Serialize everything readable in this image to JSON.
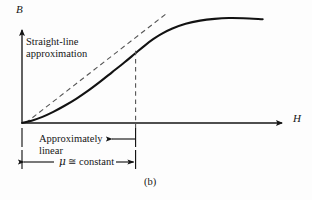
{
  "figure": {
    "caption": "(b)",
    "background_color": "#fdfdfd",
    "ink_color": "#151515",
    "curve_color": "#121212",
    "dashed_color": "#555555"
  },
  "axes": {
    "y_label": "B",
    "x_label": "H",
    "origin": {
      "x": 22,
      "y": 123
    },
    "y_axis_top": {
      "x": 22,
      "y": 27
    },
    "x_axis_right": {
      "x": 285,
      "y": 123
    }
  },
  "annotations": {
    "straight_line": {
      "line1": "Straight-line",
      "line2": "approximation"
    },
    "approximately_linear": {
      "line1": "Approximately",
      "line2": "linear"
    },
    "permeability": {
      "symbol": "μ",
      "relation": "≅",
      "value": "constant",
      "full": "μ ≅ constant"
    }
  },
  "chart_data": {
    "type": "line",
    "title": "",
    "subtitle": "",
    "xlabel": "H",
    "ylabel": "B",
    "grid": false,
    "legend": null,
    "axis_style": "arrow-headed half-axes, unlabeled ticks",
    "xlim": [
      0,
      1
    ],
    "ylim": [
      0,
      1
    ],
    "series": [
      {
        "name": "B-H magnetization curve",
        "style": "solid",
        "color": "#121212",
        "description": "S-shaped (sigmoid) saturation curve rising from the origin, steepest through the mid linear region, then flattening to saturation and drooping very slightly at the far right",
        "points": [
          {
            "x": 0.0,
            "y": 0.0
          },
          {
            "x": 0.04,
            "y": 0.022
          },
          {
            "x": 0.085,
            "y": 0.058
          },
          {
            "x": 0.13,
            "y": 0.105
          },
          {
            "x": 0.175,
            "y": 0.16
          },
          {
            "x": 0.225,
            "y": 0.228
          },
          {
            "x": 0.275,
            "y": 0.305
          },
          {
            "x": 0.325,
            "y": 0.39
          },
          {
            "x": 0.375,
            "y": 0.48
          },
          {
            "x": 0.425,
            "y": 0.57
          },
          {
            "x": 0.47,
            "y": 0.655
          },
          {
            "x": 0.51,
            "y": 0.73
          },
          {
            "x": 0.545,
            "y": 0.79
          },
          {
            "x": 0.58,
            "y": 0.84
          },
          {
            "x": 0.625,
            "y": 0.89
          },
          {
            "x": 0.68,
            "y": 0.935
          },
          {
            "x": 0.74,
            "y": 0.965
          },
          {
            "x": 0.8,
            "y": 0.982
          },
          {
            "x": 0.86,
            "y": 0.99
          },
          {
            "x": 0.92,
            "y": 0.988
          },
          {
            "x": 1.0,
            "y": 0.978
          }
        ]
      },
      {
        "name": "Straight-line approximation (tangent)",
        "style": "dashed",
        "color": "#555555",
        "description": "Dashed straight line tangent to the steep linear portion of the curve, drawn from just above the origin up beyond the knee",
        "points": [
          {
            "x": 0.015,
            "y": 0.0
          },
          {
            "x": 0.605,
            "y": 1.04
          }
        ]
      }
    ],
    "reference_lines": [
      {
        "name": "knee marker",
        "orientation": "vertical",
        "style": "dashed",
        "x": 0.472,
        "y_from": 0.0,
        "y_to": 0.68,
        "description": "Vertical dashed line dropped from the knee of the curve to the H axis, marking the end of the approximately linear region"
      }
    ],
    "dimension_markers": [
      {
        "name": "approximately-linear-extent",
        "label": "Approximately linear",
        "from_x": 0.0,
        "to_x": 0.472,
        "arrow": "left",
        "description": "Leader line with a left-pointing arrowhead running from the knee tick back toward the Approximately linear text"
      },
      {
        "name": "mu-constant-extent",
        "label": "μ ≅ constant",
        "from_x": 0.0,
        "to_x": 0.472,
        "arrow": "both",
        "description": "Double-headed dimension arrow spanning the linear region, labelled mu approximately equals constant"
      }
    ],
    "annotations": [
      {
        "text": "Straight-line approximation",
        "x": 0.02,
        "y": 0.88,
        "anchor": "left"
      },
      {
        "text": "Approximately linear",
        "x": 0.06,
        "y": -0.1,
        "anchor": "left"
      },
      {
        "text": "μ ≅ constant",
        "x": 0.14,
        "y": -0.33,
        "anchor": "left"
      },
      {
        "text": "(b)",
        "x": 0.47,
        "y": -0.55,
        "anchor": "center"
      }
    ]
  }
}
